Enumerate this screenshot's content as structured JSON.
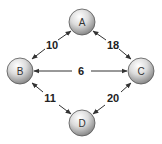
{
  "diagram": {
    "type": "weighted-graph",
    "nodes": [
      {
        "id": "A",
        "label": "A",
        "cx": 82,
        "cy": 22
      },
      {
        "id": "B",
        "label": "B",
        "cx": 20,
        "cy": 71
      },
      {
        "id": "C",
        "label": "C",
        "cx": 141,
        "cy": 71
      },
      {
        "id": "D",
        "label": "D",
        "cx": 82,
        "cy": 123
      }
    ],
    "edges": [
      {
        "from": "B",
        "to": "A",
        "weight": "10",
        "bidirectional": true
      },
      {
        "from": "A",
        "to": "C",
        "weight": "18",
        "bidirectional": true
      },
      {
        "from": "B",
        "to": "C",
        "weight": "6",
        "bidirectional": true
      },
      {
        "from": "B",
        "to": "D",
        "weight": "11",
        "bidirectional": true
      },
      {
        "from": "C",
        "to": "D",
        "weight": "20",
        "bidirectional": true
      }
    ]
  },
  "colors": {
    "node_light": "#ffffff",
    "node_dark": "#8a8a8a",
    "node_stroke": "#555555",
    "edge": "#333333"
  }
}
